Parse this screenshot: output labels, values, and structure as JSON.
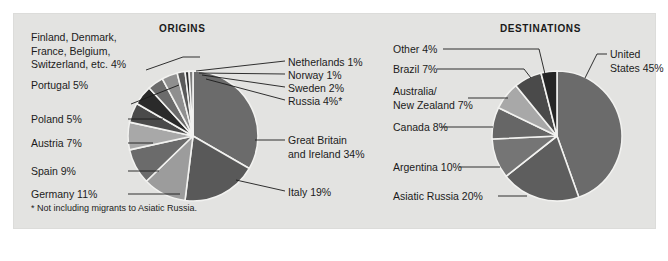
{
  "panel": {
    "background_color": "#e3e3e1",
    "outer_background_color": "#ffffff"
  },
  "footnote": "* Not including migrants to Asiatic Russia.",
  "charts": {
    "origins": {
      "title": "ORIGINS",
      "labels": {
        "scandinavia_group": "Finland, Denmark,\nFrance, Belgium,\nSwitzerland, etc. 4%",
        "portugal": "Portugal 5%",
        "poland": "Poland 5%",
        "austria": "Austria 7%",
        "spain": "Spain 9%",
        "germany": "Germany 11%",
        "netherlands": "Netherlands 1%",
        "norway": "Norway 1%",
        "sweden": "Sweden 2%",
        "russia": "Russia 4%*",
        "great_britain": "Great Britain\nand Ireland 34%",
        "italy": "Italy 19%"
      }
    },
    "destinations": {
      "title": "DESTINATIONS",
      "labels": {
        "other": "Other 4%",
        "brazil": "Brazil 7%",
        "australia_nz": "Australia/\nNew Zealand 7%",
        "canada": "Canada 8%",
        "argentina": "Argentina 10%",
        "asiatic_russia": "Asiatic Russia 20%",
        "united_states": "United\nStates 45%"
      }
    }
  },
  "chart_data": [
    {
      "type": "pie",
      "title": "ORIGINS",
      "id": "origins",
      "footnote": "* Not including migrants to Asiatic Russia.",
      "unit": "percent",
      "start_angle_deg": -90,
      "direction": "clockwise",
      "center": [
        193,
        136
      ],
      "radius": 65,
      "categories": [
        "Great Britain and Ireland",
        "Italy",
        "Germany",
        "Spain",
        "Austria",
        "Poland",
        "Portugal",
        "Finland, Denmark, France, Belgium, Switzerland, etc.",
        "Russia",
        "Sweden",
        "Norway",
        "Netherlands"
      ],
      "values": [
        34,
        19,
        11,
        9,
        7,
        5,
        5,
        4,
        4,
        2,
        1,
        1
      ],
      "labels": [
        "Great Britain and Ireland 34%",
        "Italy 19%",
        "Germany 11%",
        "Spain 9%",
        "Austria 7%",
        "Poland 5%",
        "Portugal 5%",
        "Finland, Denmark, France, Belgium, Switzerland, etc. 4%",
        "Russia 4%*",
        "Sweden 2%",
        "Norway 1%",
        "Netherlands 1%"
      ],
      "colors": [
        "#6b6b6b",
        "#595959",
        "#9c9c9c",
        "#6b6b6b",
        "#a8a8a8",
        "#4a4a4a",
        "#2a2a2a",
        "#6b6b6b",
        "#8f8f8f",
        "#5a5a5a",
        "#2d2d2d",
        "#7d7d7d"
      ],
      "legend": "callout-labels",
      "grid": false
    },
    {
      "type": "pie",
      "title": "DESTINATIONS",
      "id": "destinations",
      "unit": "percent",
      "start_angle_deg": -90,
      "direction": "clockwise",
      "center": [
        557,
        136
      ],
      "radius": 65,
      "categories": [
        "United States",
        "Asiatic Russia",
        "Argentina",
        "Canada",
        "Australia/New Zealand",
        "Brazil",
        "Other"
      ],
      "values": [
        45,
        20,
        10,
        8,
        7,
        7,
        4
      ],
      "labels": [
        "United States 45%",
        "Asiatic Russia 20%",
        "Argentina 10%",
        "Canada 8%",
        "Australia/New Zealand 7%",
        "Brazil 7%",
        "Other 4%"
      ],
      "colors": [
        "#6b6b6b",
        "#5e5e5e",
        "#757575",
        "#666666",
        "#a8a8a8",
        "#4a4a4a",
        "#262626"
      ],
      "legend": "callout-labels",
      "grid": false
    }
  ]
}
